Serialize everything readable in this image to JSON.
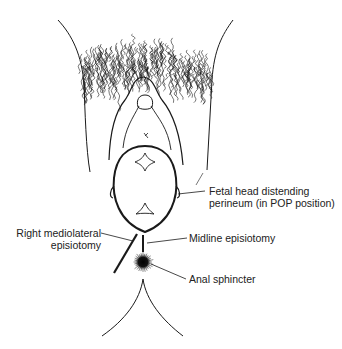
{
  "diagram": {
    "labels": {
      "fetal_head": [
        "Fetal head distending",
        "perineum (in POP position)"
      ],
      "mediolateral": [
        "Right mediolateral",
        "episiotomy"
      ],
      "midline": "Midline episiotomy",
      "anal_sphincter": "Anal sphincter"
    },
    "colors": {
      "line": "#1a1a1a",
      "text": "#222222",
      "background": "#ffffff"
    }
  }
}
